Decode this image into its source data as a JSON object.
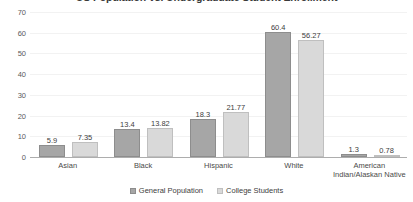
{
  "chart_data": {
    "type": "bar",
    "title": "US Population vs. Undergraduate Student Enrollment",
    "xlabel": "",
    "ylabel": "",
    "ylim": [
      0,
      70
    ],
    "yticks": [
      0,
      10,
      20,
      30,
      40,
      50,
      60,
      70
    ],
    "grid": true,
    "legend_position": "bottom",
    "categories": [
      "Asian",
      "Black",
      "Hispanic",
      "White",
      "American\nIndian/Alaskan Native"
    ],
    "series": [
      {
        "name": "General Population",
        "color": "#a6a6a6",
        "values": [
          5.9,
          13.4,
          18.3,
          60.4,
          1.3
        ],
        "labels": [
          "5.9",
          "13.4",
          "18.3",
          "60.4",
          "1.3"
        ]
      },
      {
        "name": "College Students",
        "color": "#d9d9d9",
        "values": [
          7.35,
          13.82,
          21.77,
          56.27,
          0.78
        ],
        "labels": [
          "7.35",
          "13.82",
          "21.77",
          "56.27",
          "0.78"
        ]
      }
    ]
  },
  "axis": {
    "tick_labels": [
      "70",
      "60",
      "50",
      "40",
      "30",
      "20",
      "10",
      "0"
    ]
  },
  "legend": {
    "items": [
      {
        "label": "General Population"
      },
      {
        "label": "College Students"
      }
    ]
  }
}
